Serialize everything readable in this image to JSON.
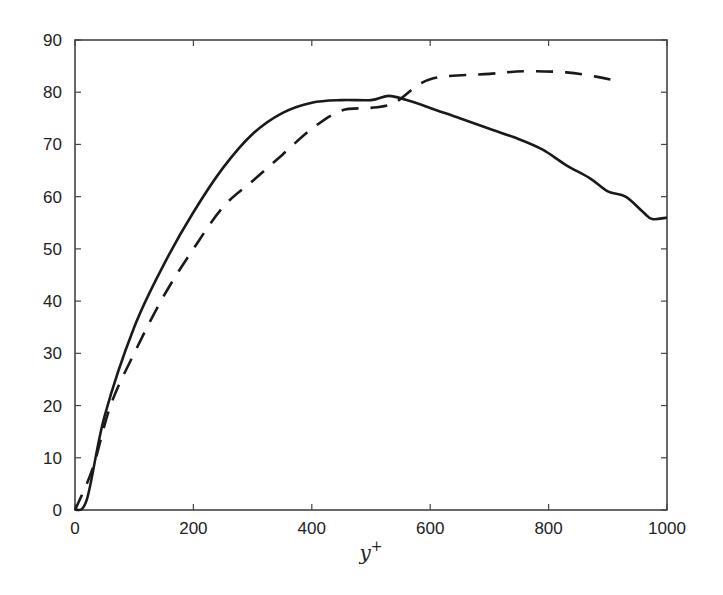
{
  "chart_data": {
    "type": "line",
    "title": "",
    "xlabel": "y+",
    "ylabel": "",
    "xlim": [
      0,
      1000
    ],
    "ylim": [
      0,
      90
    ],
    "grid": false,
    "legend": null,
    "x_ticks": [
      0,
      200,
      400,
      600,
      800,
      1000
    ],
    "y_ticks": [
      0,
      10,
      20,
      30,
      40,
      50,
      60,
      70,
      80,
      90
    ],
    "series": [
      {
        "name": "solid",
        "style": "solid",
        "color": "#1a1a1a",
        "x": [
          0,
          20,
          50,
          100,
          150,
          200,
          250,
          300,
          350,
          400,
          450,
          500,
          530,
          560,
          600,
          650,
          700,
          750,
          790,
          830,
          870,
          900,
          930,
          960,
          975,
          1000
        ],
        "y": [
          0,
          2,
          18,
          35,
          47,
          57,
          65.5,
          72,
          76,
          78,
          78.5,
          78.5,
          79.3,
          78.5,
          77,
          75,
          73,
          71,
          69,
          66,
          63.5,
          61,
          60,
          57,
          55.7,
          56
        ]
      },
      {
        "name": "dashed",
        "style": "dashed",
        "color": "#1a1a1a",
        "x": [
          0,
          30,
          60,
          100,
          150,
          200,
          250,
          300,
          350,
          400,
          450,
          500,
          540,
          600,
          700,
          760,
          830,
          880,
          910
        ],
        "y": [
          0,
          8,
          20,
          30,
          41,
          50,
          58,
          63,
          68,
          73,
          76.5,
          77,
          78,
          82.5,
          83.5,
          84,
          83.8,
          83,
          82.3
        ]
      }
    ]
  }
}
